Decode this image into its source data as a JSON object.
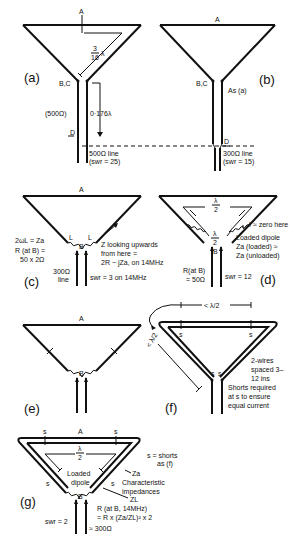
{
  "figure": {
    "panels": {
      "a": {
        "label": "(a)",
        "point_a": "A",
        "feed_point": "B,C",
        "fraction_num": "3",
        "fraction_den": "16",
        "lambda": "λ",
        "line_impedance": "(500Ω)",
        "line_length": "0·176λ",
        "point_d": "D",
        "line_desc": "500Ω line",
        "swr": "(swr = 25)"
      },
      "b": {
        "label": "(b)",
        "point_a": "A",
        "feed_point": "B,C",
        "note": "As (a)",
        "point_d": "D",
        "line_desc": "300Ω line",
        "swr": "(swr = 15)"
      },
      "c": {
        "label": "(c)",
        "point_a": "A",
        "inductor_l": "L",
        "feed_point": "B",
        "eq1": "2ωL = Za",
        "eq2": "R (at B) =",
        "eq3": "50 x 2Ω",
        "line1": "300Ω",
        "line2": "line",
        "z_note1": "Z looking upwards",
        "z_note2": "from here =",
        "z_note3": "2R − jZa, on 14MHz",
        "swr": "swr = 3 on 14MHz"
      },
      "d": {
        "label": "(d)",
        "half_lambda_num": "λ",
        "half_lambda_den": "2",
        "feed_point": "B",
        "i_note": "I ≈ zero here",
        "loaded1": "Loaded dipole",
        "loaded2": "Za (loaded) ≈",
        "loaded3": "Za (unloaded)",
        "r1": "R(at B)",
        "r2": "= 50Ω",
        "swr": "swr = 12"
      },
      "e": {
        "label": "(e)",
        "point_a": "A",
        "feed_point": "B"
      },
      "f": {
        "label": "(f)",
        "short": "s",
        "less_half_lambda": "< λ/2",
        "note1": "2-wires",
        "note2": "spaced 3–",
        "note3": "12 ins",
        "note4": "Shorts required",
        "note5": "at s to ensure",
        "note6": "equal current"
      },
      "g": {
        "label": "(g)",
        "point_a": "A",
        "short": "s",
        "feed_point": "B",
        "shorts_note1": "s = shorts",
        "shorts_note2": "as (f)",
        "loaded1": "Loaded",
        "loaded2": "dipole",
        "za": "Za",
        "char1": "Characteristic",
        "char2": "impedances",
        "zl": "ZL",
        "r1": "R (at B, 14MHz)",
        "r2": "= R x (Za/ZL)² x 2",
        "swr": "swr = 2",
        "imp": "≈ 300Ω"
      }
    }
  }
}
